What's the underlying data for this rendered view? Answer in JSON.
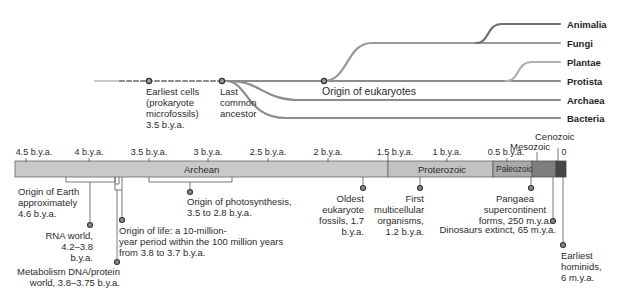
{
  "tree": {
    "kingdoms": [
      {
        "label": "Animalia",
        "y": 24
      },
      {
        "label": "Fungi",
        "y": 43
      },
      {
        "label": "Plantae",
        "y": 62
      },
      {
        "label": "Protista",
        "y": 81
      },
      {
        "label": "Archaea",
        "y": 100
      },
      {
        "label": "Bacteria",
        "y": 118
      }
    ],
    "nodes": {
      "earliest_cells": "Earliest cells\n(prokaryote\nmicrofossils)\n3.5 b.y.a.",
      "last_common_ancestor": "Last\ncommon\nancestor",
      "origin_eukaryotes": "Origin of eukaryotes"
    }
  },
  "timeline": {
    "ticks": [
      {
        "label": "4.5 b.y.a.",
        "x": 26
      },
      {
        "label": "4 b.y.a.",
        "x": 89
      },
      {
        "label": "3.5 b.y.a.",
        "x": 149
      },
      {
        "label": "3 b.y.a.",
        "x": 208
      },
      {
        "label": "2.5 b.y.a.",
        "x": 268
      },
      {
        "label": "2 b.y.a.",
        "x": 328
      },
      {
        "label": "1.5 b.y.a.",
        "x": 388
      },
      {
        "label": "1 b.y.a.",
        "x": 447
      },
      {
        "label": "0.5 b.y.a.",
        "x": 507
      },
      {
        "label": "0",
        "x": 566
      }
    ],
    "eras": {
      "archean": "Archean",
      "proterozoic": "Proterozoic",
      "paleozoic": "Paleozoic",
      "mesozoic": "Mesozoic",
      "cenozoic": "Cenozoic"
    },
    "colors": {
      "archean": "#c9c9c9",
      "proterozoic": "#c4c4c4",
      "paleozoic": "#a9a9a9",
      "mesozoic": "#7d7d7d",
      "cenozoic": "#474747"
    }
  },
  "events": {
    "origin_earth": "Origin of Earth\napproximately\n4.6 b.y.a.",
    "rna_world": "RNA world,\n4.2–3.8 b.y.a.",
    "metabolism": "Metabolism DNA/protein\nworld, 3.8–3.75 b.y.a.",
    "origin_life": "Origin of life: a 10-million-\nyear period within the 100 million years\nfrom 3.8 to 3.7 b.y.a.",
    "photosynthesis": "Origin of photosynthesis,\n3.5 to 2.8 b.y.a.",
    "eukaryote_fossils": "Oldest eukaryote\nfossils, 1.7 b.y.a.",
    "multicellular": "First\nmulticellular\norganisms,\n1.2 b.y.a.",
    "pangaea": "Pangaea\nsupercontinent\nforms, 250 m.y.a.",
    "dinosaurs": "Dinosaurs extinct, 65 m.y.a.",
    "hominids": "Earliest\nhominids,\n6 m.y.a."
  }
}
